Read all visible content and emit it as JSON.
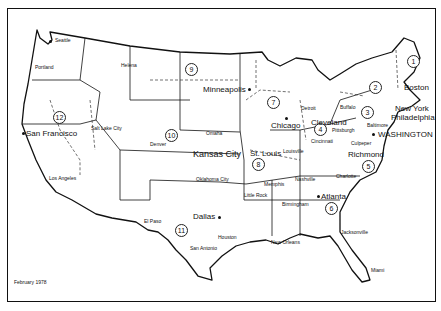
{
  "map": {
    "title": "Federal Reserve Districts",
    "date": "February 1978",
    "districts": [
      {
        "number": "1",
        "x": 412,
        "y": 60
      },
      {
        "number": "2",
        "x": 374,
        "y": 86
      },
      {
        "number": "3",
        "x": 366,
        "y": 111
      },
      {
        "number": "4",
        "x": 319,
        "y": 128
      },
      {
        "number": "5",
        "x": 367,
        "y": 165
      },
      {
        "number": "6",
        "x": 330,
        "y": 207
      },
      {
        "number": "7",
        "x": 272,
        "y": 101
      },
      {
        "number": "8",
        "x": 257,
        "y": 163
      },
      {
        "number": "9",
        "x": 190,
        "y": 68
      },
      {
        "number": "10",
        "x": 170,
        "y": 134
      },
      {
        "number": "11",
        "x": 180,
        "y": 229
      },
      {
        "number": "12",
        "x": 58,
        "y": 116
      }
    ],
    "reserve_bank_cities": [
      {
        "name": "Boston",
        "x": 404,
        "y": 84,
        "size": "m"
      },
      {
        "name": "New York",
        "x": 395,
        "y": 107,
        "size": "m"
      },
      {
        "name": "Philadelphia",
        "x": 391,
        "y": 116,
        "size": "m"
      },
      {
        "name": "WASHINGTON",
        "x": 378,
        "y": 132,
        "size": "m"
      },
      {
        "name": "Cleveland",
        "x": 311,
        "y": 120,
        "size": "m"
      },
      {
        "name": "Richmond",
        "x": 348,
        "y": 149,
        "size": "m"
      },
      {
        "name": "Atlanta",
        "x": 321,
        "y": 193,
        "size": "m"
      },
      {
        "name": "Chicago",
        "x": 271,
        "y": 122,
        "size": "m"
      },
      {
        "name": "St. Louis",
        "x": 250,
        "y": 149,
        "size": "m"
      },
      {
        "name": "Minneapolis",
        "x": 204,
        "y": 86,
        "size": "m"
      },
      {
        "name": "Kansas City",
        "x": 193,
        "y": 150,
        "size": "l"
      },
      {
        "name": "Dallas",
        "x": 193,
        "y": 214,
        "size": "m"
      },
      {
        "name": "San Francisco",
        "x": 26,
        "y": 131,
        "size": "m"
      }
    ],
    "branch_cities": [
      {
        "name": "Seattle",
        "x": 55,
        "y": 38
      },
      {
        "name": "Portland",
        "x": 35,
        "y": 65
      },
      {
        "name": "Helena",
        "x": 121,
        "y": 63
      },
      {
        "name": "Salt Lake City",
        "x": 91,
        "y": 126
      },
      {
        "name": "Los Angeles",
        "x": 49,
        "y": 175
      },
      {
        "name": "Denver",
        "x": 150,
        "y": 142
      },
      {
        "name": "Omaha",
        "x": 206,
        "y": 130
      },
      {
        "name": "Oklahoma City",
        "x": 196,
        "y": 177
      },
      {
        "name": "El Paso",
        "x": 144,
        "y": 219
      },
      {
        "name": "Houston",
        "x": 218,
        "y": 236
      },
      {
        "name": "San Antonio",
        "x": 190,
        "y": 246
      },
      {
        "name": "Little Rock",
        "x": 244,
        "y": 197
      },
      {
        "name": "Memphis",
        "x": 264,
        "y": 184
      },
      {
        "name": "Louisville",
        "x": 283,
        "y": 149
      },
      {
        "name": "Nashville",
        "x": 295,
        "y": 178
      },
      {
        "name": "Birmingham",
        "x": 280,
        "y": 203
      },
      {
        "name": "New Orleans",
        "x": 271,
        "y": 240
      },
      {
        "name": "Jacksonville",
        "x": 341,
        "y": 230
      },
      {
        "name": "Miami",
        "x": 371,
        "y": 268
      },
      {
        "name": "Charlotte",
        "x": 336,
        "y": 175
      },
      {
        "name": "Baltimore",
        "x": 367,
        "y": 124
      },
      {
        "name": "Culpeper",
        "x": 351,
        "y": 141
      },
      {
        "name": "Pittsburgh",
        "x": 332,
        "y": 128
      },
      {
        "name": "Cincinnati",
        "x": 311,
        "y": 139
      },
      {
        "name": "Buffalo",
        "x": 340,
        "y": 106
      },
      {
        "name": "Detroit",
        "x": 301,
        "y": 106
      }
    ]
  }
}
